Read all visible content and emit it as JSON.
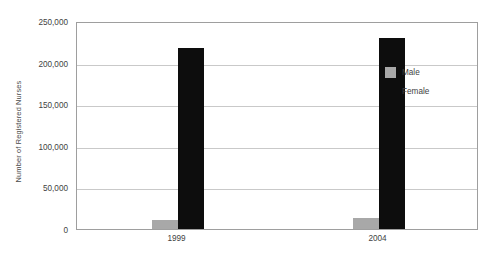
{
  "chart_data": {
    "type": "bar",
    "title": "",
    "xlabel": "",
    "ylabel": "Number of Registered Nurses",
    "categories": [
      "1999",
      "2004"
    ],
    "series": [
      {
        "name": "Male",
        "color": "#a8a8a8",
        "values": [
          11000,
          13000
        ]
      },
      {
        "name": "Female",
        "color": "#0d0d0d",
        "values": [
          217000,
          229000
        ]
      }
    ],
    "ylim": [
      0,
      250000
    ],
    "ytick_values": [
      0,
      50000,
      100000,
      150000,
      200000,
      250000
    ],
    "ytick_labels": [
      "0",
      "50,000",
      "100,000",
      "150,000",
      "200,000",
      "250,000"
    ],
    "grid": true,
    "legend_position": "right-inside"
  }
}
